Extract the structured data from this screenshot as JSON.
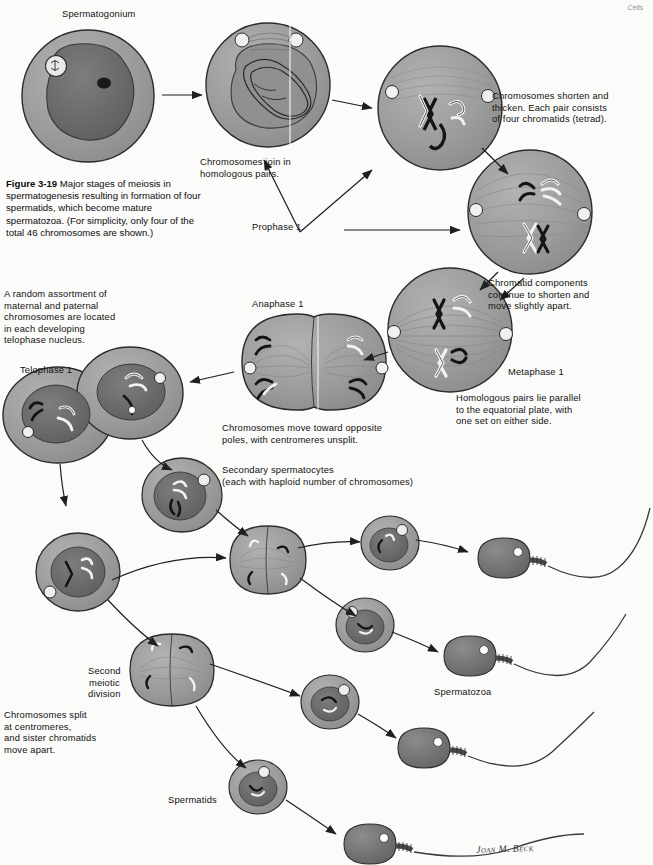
{
  "page": {
    "running_head": "Cells",
    "background_color": "#fbfbf9",
    "width": 653,
    "height": 865
  },
  "caption": {
    "figure_number": "Figure 3-19",
    "text": "  Major stages of meiosis in spermatogenesis resulting in formation of four spermatids, which become mature spermatozoa. (For simplicity, only four of the total 46 chromosomes are shown.)"
  },
  "labels": {
    "spermatogonium": "Spermatogonium",
    "chromosomes_join": "Chromosomes join in\nhomologous pairs.",
    "prophase1": "Prophase 1",
    "chromosomes_shorten": "Chromosomes shorten and\nthicken. Each pair consists\nof four chromatids (tetrad).",
    "chromatid_components": "Chromatid components\ncontinue  to shorten and\nmove slightly apart.",
    "metaphase1": "Metaphase 1",
    "homologous_pairs": "Homologous pairs lie parallel\nto the equatorial plate, with\none set on either side.",
    "random_assortment": "A random assortment of\nmaternal and paternal\nchromosomes are located\nin each developing\ntelophase nucleus.",
    "telophase1": "Telophase 1",
    "anaphase1": "Anaphase 1",
    "chromosomes_move": "Chromosomes move toward opposite\npoles, with centromeres unsplit.",
    "secondary_spermatocytes": "Secondary spermatocytes\n(each with haploid number of chromosomes)",
    "second_meiotic_division": "Second\nmeiotic\ndivision",
    "chromosomes_split": "Chromosomes split\nat centromeres,\nand sister chromatids\nmove apart.",
    "spermatids": "Spermatids",
    "spermatozoa": "Spermatozoa",
    "artist_signature": "Joan M. Beck"
  },
  "colors": {
    "cytoplasm": "#9a9a9a",
    "cytoplasm_dark": "#858585",
    "nucleus": "#6e6e6e",
    "nucleus_dark": "#5a5a5a",
    "outline": "#2b2b2b",
    "chromosome_dark": "#141414",
    "chromosome_light": "#f2f2f2",
    "spindle": "#7d7d7d",
    "sperm_head": "#6f6f6f",
    "arrow": "#1f1f1f",
    "text": "#121212",
    "running_head": "#8a8a8a"
  },
  "diagram": {
    "type": "biological-process-diagram",
    "subject": "Meiosis in spermatogenesis",
    "stages": [
      {
        "name": "Spermatogonium",
        "cell_shape": "round",
        "cx": 88,
        "cy": 96,
        "r": 66
      },
      {
        "name": "Prophase 1 early (leptotene/zygotene)",
        "cell_shape": "round",
        "cx": 268,
        "cy": 85,
        "r": 62
      },
      {
        "name": "Prophase 1 late (tetrad)",
        "cell_shape": "round",
        "cx": 440,
        "cy": 108,
        "r": 62
      },
      {
        "name": "Prophase 1 / diakinesis",
        "cell_shape": "round",
        "cx": 530,
        "cy": 212,
        "r": 62
      },
      {
        "name": "Metaphase 1",
        "cell_shape": "round",
        "cx": 450,
        "cy": 330,
        "r": 62
      },
      {
        "name": "Anaphase 1",
        "cell_shape": "dividing",
        "cx": 300,
        "cy": 362,
        "r": 58
      },
      {
        "name": "Telophase 1",
        "cell_shape": "two-cells",
        "cx": 85,
        "cy": 410,
        "r": 58
      },
      {
        "name": "Secondary spermatocyte A",
        "cell_shape": "round",
        "cx": 182,
        "cy": 495,
        "r": 38
      },
      {
        "name": "Secondary spermatocyte B",
        "cell_shape": "round",
        "cx": 78,
        "cy": 570,
        "r": 40
      },
      {
        "name": "Second meiotic division A",
        "cell_shape": "dividing",
        "cx": 268,
        "cy": 560,
        "r": 40
      },
      {
        "name": "Second meiotic division B",
        "cell_shape": "dividing",
        "cx": 172,
        "cy": 670,
        "r": 42
      },
      {
        "name": "Spermatid 1",
        "cell_shape": "round",
        "cx": 390,
        "cy": 543,
        "r": 27
      },
      {
        "name": "Spermatid 2",
        "cell_shape": "round",
        "cx": 365,
        "cy": 625,
        "r": 27
      },
      {
        "name": "Spermatid 3",
        "cell_shape": "round",
        "cx": 330,
        "cy": 700,
        "r": 27
      },
      {
        "name": "Spermatid 4",
        "cell_shape": "round",
        "cx": 258,
        "cy": 785,
        "r": 27
      },
      {
        "name": "Spermatozoon 1",
        "head_cx": 505,
        "head_cy": 555
      },
      {
        "name": "Spermatozoon 2",
        "head_cx": 470,
        "head_cy": 653
      },
      {
        "name": "Spermatozoon 3",
        "head_cx": 425,
        "head_cy": 745
      },
      {
        "name": "Spermatozoon 4",
        "head_cx": 370,
        "head_cy": 840
      }
    ]
  }
}
